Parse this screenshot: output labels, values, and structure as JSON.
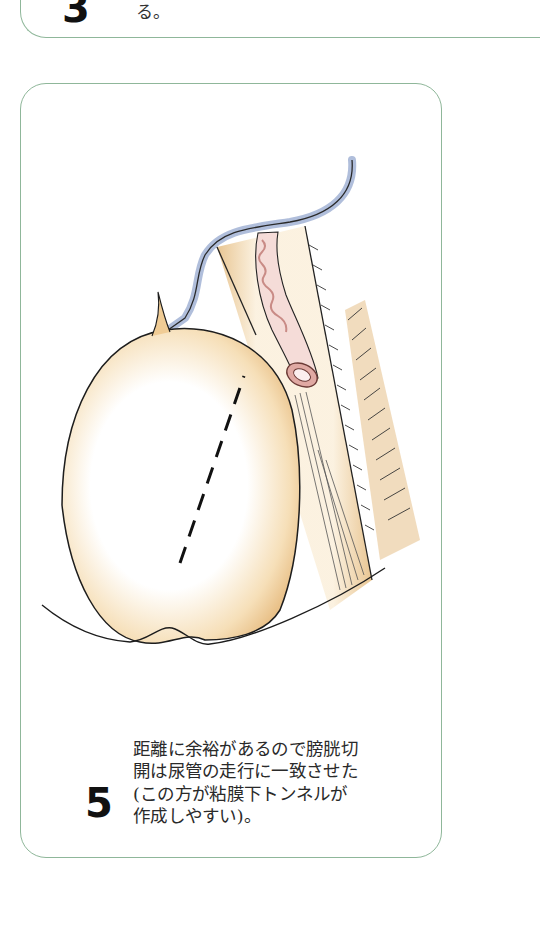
{
  "previous_card": {
    "step_number": "3",
    "text_tail": "る。"
  },
  "card": {
    "step_number": "5",
    "caption_lines": [
      "距離に余裕があるので膀胱切",
      "開は尿管の走行に一致させた",
      "(この方が粘膜下トンネルが",
      "作成しやすい)。"
    ]
  },
  "colors": {
    "card_border": "#8fb79a",
    "bladder_fill": "#f2d3a0",
    "peritoneum_blue": "#7e95c2",
    "ureter_pink": "#d9a39e",
    "ureter_outline": "#8b4a45",
    "line": "#1a1a1a"
  },
  "illustration": {
    "description": "Surgical illustration: bladder with dashed incision line aligned with ureter course; ureter with orifice in tunnel beside bladder; peritoneum edge in blue"
  }
}
